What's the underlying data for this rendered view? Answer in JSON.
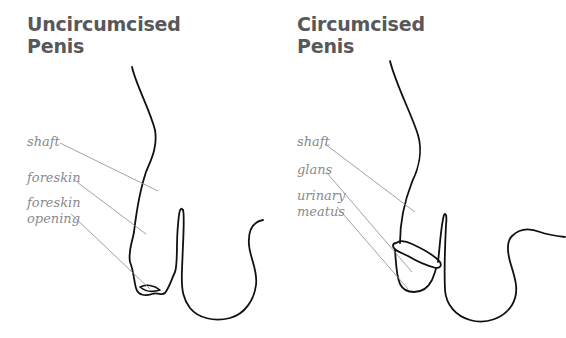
{
  "diagrams": [
    {
      "title_line1": "Uncircumcised",
      "title_line2": "Penis",
      "labels": [
        {
          "text": "shaft"
        },
        {
          "text": "foreskin"
        },
        {
          "text_line1": "foreskin",
          "text_line2": "opening"
        }
      ]
    },
    {
      "title_line1": "Circumcised",
      "title_line2": "Penis",
      "labels": [
        {
          "text": "shaft"
        },
        {
          "text": "glans"
        },
        {
          "text_line1": "urinary",
          "text_line2": "meatus"
        }
      ]
    }
  ],
  "colors": {
    "title": "#58585a",
    "label": "#8a8a8c",
    "leader_line": "#8a8a8a",
    "outline": "#111111",
    "background": "#ffffff"
  }
}
